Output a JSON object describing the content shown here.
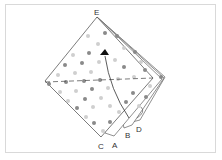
{
  "diagram": {
    "labels": {
      "top": "E",
      "bottom_left": "C",
      "layer_a": "A",
      "layer_b": "B",
      "layer_d": "D"
    },
    "colors": {
      "line": "#444444",
      "dot_dark": "#8a8a8a",
      "dot_light": "#cfcfcf",
      "frame": "#d9d9d9"
    }
  }
}
